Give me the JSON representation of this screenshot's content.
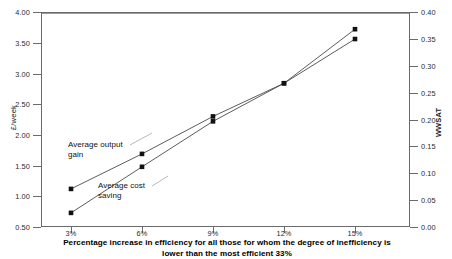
{
  "top_note": "",
  "chart_data": {
    "type": "line",
    "title": "",
    "xlabel": "Percentage increase in efficiency for all those for whom the degree of inefficiency is lower than the most efficient 33%",
    "xlabel_line1": "Percentage increase in efficiency for all those for whom the degree of inefficiency is",
    "xlabel_line2": "lower than the most efficient 33%",
    "ylabel_left": "£/week",
    "ylabel_right": "WWSAT",
    "categories": [
      "3%",
      "6%",
      "9%",
      "12%",
      "15%"
    ],
    "x_ticks": [
      "3%",
      "6%",
      "9%",
      "12%",
      "15%"
    ],
    "y_ticks_left": [
      "0.50",
      "1.00",
      "1.50",
      "2.00",
      "2.50",
      "3.00",
      "3.50",
      "4.00"
    ],
    "y_ticks_right": [
      "0.00",
      "0.05",
      "0.10",
      "0.15",
      "0.20",
      "0.25",
      "0.30",
      "0.35",
      "0.40"
    ],
    "ylim_left": [
      0.5,
      4.0
    ],
    "ylim_right": [
      0.0,
      0.4
    ],
    "grid": false,
    "legend": "annotations-inline",
    "series": [
      {
        "name": "Average output gain",
        "axis": "left",
        "marker": "square",
        "values": [
          1.12,
          1.69,
          2.3,
          2.84,
          3.72
        ]
      },
      {
        "name": "Average cost saving",
        "axis": "left",
        "marker": "square",
        "values": [
          0.73,
          1.48,
          2.22,
          2.84,
          3.56
        ]
      }
    ],
    "annotations": [
      {
        "text": "Average output\ngain",
        "series": "Average output gain"
      },
      {
        "text": "Average cost\nsaving",
        "series": "Average cost saving"
      }
    ]
  }
}
